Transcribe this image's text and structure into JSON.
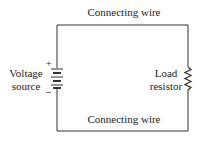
{
  "diagram": {
    "labels": {
      "top_wire": "Connecting wire",
      "bottom_wire": "Connecting wire",
      "source_line1": "Voltage",
      "source_line2": "source",
      "load_line1": "Load",
      "load_line2": "resistor",
      "plus": "+",
      "minus": "–"
    },
    "components": [
      {
        "type": "battery",
        "name": "Voltage source",
        "polarity": {
          "top": "+",
          "bottom": "–"
        }
      },
      {
        "type": "resistor",
        "name": "Load resistor"
      },
      {
        "type": "wire",
        "name": "Connecting wire",
        "position": "top"
      },
      {
        "type": "wire",
        "name": "Connecting wire",
        "position": "bottom"
      }
    ],
    "colors": {
      "line": "#333333",
      "text": "#222222",
      "background": "#ffffff"
    }
  }
}
